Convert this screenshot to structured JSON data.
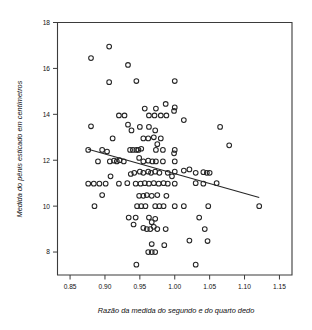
{
  "chart_data": {
    "type": "scatter",
    "title": "",
    "xlabel": "Razão da medida do segundo e do quarto dedo",
    "ylabel": "Medida do pênis esticado em centímetros",
    "xlim": [
      0.832,
      1.168
    ],
    "ylim": [
      7.0,
      18.0
    ],
    "xticks": [
      0.85,
      0.9,
      0.95,
      1.0,
      1.05,
      1.1,
      1.15
    ],
    "xticklabels": [
      "0.85",
      "0.90",
      "0.95",
      "1.00",
      "1.05",
      "1.10",
      "1.15"
    ],
    "yticks": [
      8,
      10,
      12,
      14,
      16,
      18
    ],
    "yticklabels": [
      "8",
      "10",
      "12",
      "14",
      "16",
      "18"
    ],
    "grid": false,
    "legend": null,
    "marker": "open-circle",
    "point_color": "#262626",
    "trendline": {
      "name": "linear-fit",
      "x": [
        0.876,
        1.121
      ],
      "y": [
        12.48,
        10.38
      ],
      "color": "#262626"
    },
    "points": [
      [
        0.88,
        16.45
      ],
      [
        0.906,
        16.95
      ],
      [
        0.933,
        16.15
      ],
      [
        0.906,
        15.4
      ],
      [
        0.945,
        15.45
      ],
      [
        1.0,
        15.45
      ],
      [
        0.957,
        14.25
      ],
      [
        0.973,
        14.25
      ],
      [
        0.987,
        14.45
      ],
      [
        1.0,
        14.3
      ],
      [
        0.999,
        14.15
      ],
      [
        0.963,
        13.95
      ],
      [
        0.971,
        13.95
      ],
      [
        0.98,
        13.95
      ],
      [
        0.988,
        13.95
      ],
      [
        0.92,
        13.95
      ],
      [
        0.928,
        13.95
      ],
      [
        1.013,
        13.75
      ],
      [
        0.88,
        13.48
      ],
      [
        0.933,
        13.55
      ],
      [
        0.938,
        13.3
      ],
      [
        0.95,
        13.45
      ],
      [
        0.963,
        13.45
      ],
      [
        0.972,
        13.3
      ],
      [
        1.065,
        13.45
      ],
      [
        0.911,
        12.95
      ],
      [
        0.955,
        12.95
      ],
      [
        0.962,
        12.95
      ],
      [
        0.97,
        13.0
      ],
      [
        0.975,
        12.7
      ],
      [
        0.98,
        12.95
      ],
      [
        1.078,
        12.65
      ],
      [
        0.876,
        12.45
      ],
      [
        0.896,
        12.45
      ],
      [
        0.903,
        12.38
      ],
      [
        0.94,
        12.45
      ],
      [
        0.945,
        12.45
      ],
      [
        0.948,
        12.45
      ],
      [
        0.952,
        12.5
      ],
      [
        0.936,
        12.45
      ],
      [
        0.973,
        12.45
      ],
      [
        0.983,
        12.45
      ],
      [
        1.0,
        12.45
      ],
      [
        0.999,
        12.3
      ],
      [
        0.89,
        11.95
      ],
      [
        0.907,
        11.95
      ],
      [
        0.913,
        11.98
      ],
      [
        0.917,
        11.95
      ],
      [
        0.921,
        12.0
      ],
      [
        0.927,
        11.95
      ],
      [
        0.949,
        12.1
      ],
      [
        0.955,
        11.95
      ],
      [
        0.962,
        11.98
      ],
      [
        0.968,
        11.95
      ],
      [
        0.973,
        11.95
      ],
      [
        0.983,
        11.95
      ],
      [
        1.0,
        11.95
      ],
      [
        0.937,
        11.4
      ],
      [
        0.942,
        11.45
      ],
      [
        0.95,
        11.5
      ],
      [
        0.955,
        11.45
      ],
      [
        0.962,
        11.5
      ],
      [
        0.966,
        11.45
      ],
      [
        0.972,
        11.5
      ],
      [
        0.978,
        11.45
      ],
      [
        0.99,
        11.45
      ],
      [
        0.996,
        11.3
      ],
      [
        1.0,
        11.5
      ],
      [
        1.013,
        11.55
      ],
      [
        1.021,
        11.6
      ],
      [
        1.03,
        11.45
      ],
      [
        1.041,
        11.48
      ],
      [
        1.046,
        11.45
      ],
      [
        1.05,
        11.45
      ],
      [
        0.908,
        11.3
      ],
      [
        0.876,
        10.98
      ],
      [
        0.884,
        10.98
      ],
      [
        0.892,
        10.98
      ],
      [
        0.901,
        10.98
      ],
      [
        0.92,
        10.98
      ],
      [
        0.932,
        11.0
      ],
      [
        0.944,
        10.98
      ],
      [
        0.951,
        10.98
      ],
      [
        0.957,
        11.0
      ],
      [
        0.963,
        10.98
      ],
      [
        0.97,
        11.0
      ],
      [
        0.977,
        10.98
      ],
      [
        0.984,
        11.0
      ],
      [
        0.99,
        10.98
      ],
      [
        1.0,
        10.98
      ],
      [
        1.03,
        11.0
      ],
      [
        1.041,
        10.98
      ],
      [
        1.06,
        11.0
      ],
      [
        0.896,
        10.48
      ],
      [
        0.949,
        10.45
      ],
      [
        0.955,
        10.45
      ],
      [
        0.96,
        10.48
      ],
      [
        0.967,
        10.45
      ],
      [
        0.975,
        10.48
      ],
      [
        0.988,
        10.45
      ],
      [
        0.885,
        10.0
      ],
      [
        0.946,
        10.0
      ],
      [
        0.952,
        10.0
      ],
      [
        0.958,
        10.0
      ],
      [
        0.972,
        10.0
      ],
      [
        0.978,
        10.0
      ],
      [
        0.984,
        10.0
      ],
      [
        1.0,
        10.0
      ],
      [
        1.013,
        10.0
      ],
      [
        1.048,
        10.0
      ],
      [
        1.121,
        10.0
      ],
      [
        0.934,
        9.5
      ],
      [
        0.944,
        9.5
      ],
      [
        0.963,
        9.5
      ],
      [
        0.967,
        9.3
      ],
      [
        0.972,
        9.45
      ],
      [
        1.035,
        9.5
      ],
      [
        0.941,
        9.2
      ],
      [
        0.955,
        9.05
      ],
      [
        0.96,
        9.0
      ],
      [
        0.965,
        9.0
      ],
      [
        0.97,
        9.1
      ],
      [
        0.975,
        9.0
      ],
      [
        0.987,
        9.0
      ],
      [
        1.043,
        9.0
      ],
      [
        0.967,
        8.35
      ],
      [
        0.985,
        8.3
      ],
      [
        1.021,
        8.5
      ],
      [
        1.047,
        8.48
      ],
      [
        0.962,
        8.0
      ],
      [
        0.967,
        8.0
      ],
      [
        0.972,
        8.0
      ],
      [
        0.945,
        7.45
      ],
      [
        1.03,
        7.45
      ]
    ]
  }
}
